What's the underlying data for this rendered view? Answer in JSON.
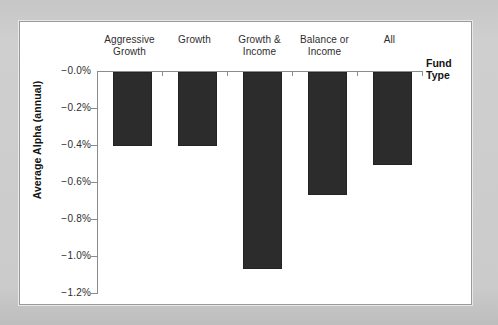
{
  "figure": {
    "background_color": "#c9c9c9",
    "panel_color": "#ffffff",
    "panel_border_color": "#9a9a9a"
  },
  "axis": {
    "y_title": "Average Alpha (annual)",
    "x_title": "Fund\nType",
    "y_ticks": [
      "−0.0%",
      "−0.2%",
      "−0.4%",
      "−0.6%",
      "−0.8%",
      "−1.0%",
      "−1.2%"
    ],
    "x_categories": [
      "Aggressive\nGrowth",
      "Growth",
      "Growth &\nIncome",
      "Balance or\nIncome",
      "All"
    ]
  },
  "chart_data": {
    "type": "bar",
    "title": "",
    "subtitle": "",
    "xlabel": "Fund Type",
    "ylabel": "Average Alpha (annual)",
    "categories": [
      "Aggressive Growth",
      "Growth",
      "Growth & Income",
      "Balance or Income",
      "All"
    ],
    "values": [
      -0.4,
      -0.4,
      -1.06,
      -0.66,
      -0.5
    ],
    "ylim": [
      -1.2,
      0.0
    ],
    "ytick_values": [
      0.0,
      -0.2,
      -0.4,
      -0.6,
      -0.8,
      -1.0,
      -1.2
    ],
    "ytick_labels": [
      "−0.0%",
      "−0.2%",
      "−0.4%",
      "−0.6%",
      "−0.8%",
      "−1.0%",
      "−1.2%"
    ],
    "bar_color": "#2c2c2c",
    "grid": false,
    "legend": false,
    "legend_position": "none",
    "orientation": "vertical",
    "value_unit": "percent",
    "annotations": []
  }
}
